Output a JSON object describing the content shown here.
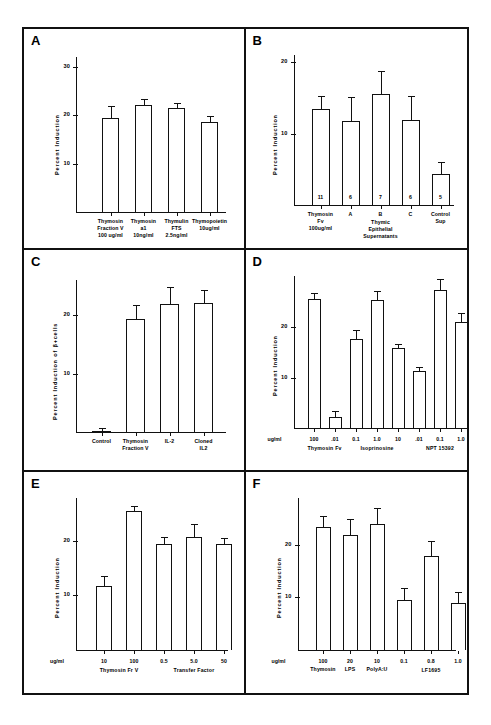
{
  "figure": {
    "panels": [
      "A",
      "B",
      "C",
      "D",
      "E",
      "F"
    ]
  },
  "chart_data": [
    {
      "panel": "A",
      "type": "bar",
      "title": "",
      "ylabel": "Percent Induction",
      "xlabel": "",
      "ylim": [
        0,
        32
      ],
      "yticks": [
        10,
        20,
        30
      ],
      "ytick_labels": [
        "10",
        "20",
        "30"
      ],
      "grid": false,
      "categories": [
        "Thymosin Fraction V 100 ug/ml",
        "Thymosin a1 10ng/ml",
        "Thymulin FTS 2.5ng/ml",
        "Thymopoietin 10ug/ml"
      ],
      "xtick_labels": [
        [
          "Thymosin",
          "Fraction V",
          "100 ug/ml"
        ],
        [
          "Thymosin",
          "a1",
          "10ng/ml"
        ],
        [
          "Thymulin",
          "FTS",
          "2.5ng/ml"
        ],
        [
          "Thymopoietin",
          "",
          "10ug/ml"
        ]
      ],
      "values": [
        19.5,
        22.0,
        21.5,
        18.5
      ],
      "errors": [
        2.4,
        1.3,
        1.0,
        1.4
      ]
    },
    {
      "panel": "B",
      "type": "bar",
      "title": "",
      "ylabel": "Percent Induction",
      "xlabel": "",
      "ylim": [
        0,
        21
      ],
      "yticks": [
        10,
        20
      ],
      "ytick_labels": [
        "10",
        "20"
      ],
      "grid": false,
      "categories": [
        "Thymosin Fv 100ug/ml",
        "A",
        "B",
        "C",
        "Control Sup"
      ],
      "xtick_labels": [
        [
          "Thymosin",
          "Fv",
          "100ug/ml"
        ],
        [
          "A",
          "",
          ""
        ],
        [
          "B",
          "",
          ""
        ],
        [
          "C",
          "",
          ""
        ],
        [
          "Control",
          "Sup",
          ""
        ]
      ],
      "group_labels": [
        "Thymic Epithelial Supernatants"
      ],
      "values": [
        13.4,
        11.8,
        15.6,
        11.9,
        4.3
      ],
      "errors": [
        1.8,
        3.3,
        3.2,
        3.3,
        1.7
      ],
      "n_labels": [
        "11",
        "6",
        "7",
        "6",
        "5"
      ]
    },
    {
      "panel": "C",
      "type": "bar",
      "title": "",
      "ylabel": "Percent Induction of β+cells",
      "xlabel": "",
      "ylim": [
        0,
        26
      ],
      "yticks": [
        10,
        20
      ],
      "ytick_labels": [
        "10",
        "20"
      ],
      "grid": false,
      "categories": [
        "Control",
        "Thymosin Fraction V",
        "IL-2",
        "Cloned IL2"
      ],
      "xtick_labels": [
        [
          "Control",
          ""
        ],
        [
          "Thymosin",
          "Fraction V"
        ],
        [
          "IL-2",
          ""
        ],
        [
          "Cloned",
          "IL2"
        ]
      ],
      "values": [
        0.3,
        19.4,
        22.0,
        22.1
      ],
      "errors": [
        0.4,
        2.3,
        2.8,
        2.2
      ]
    },
    {
      "panel": "D",
      "type": "bar",
      "title": "",
      "ylabel": "Percent Induction",
      "xlabel": "",
      "ylim": [
        0,
        30
      ],
      "yticks": [
        10,
        20
      ],
      "ytick_labels": [
        "10",
        "20"
      ],
      "grid": false,
      "unit_label": "ug/ml",
      "categories": [
        "100",
        ".01",
        "0.1",
        "1.0",
        "10",
        ".01",
        "0.1",
        "1.0"
      ],
      "values": [
        25.5,
        2.3,
        17.6,
        25.4,
        15.8,
        11.4,
        27.3,
        21.0
      ],
      "errors": [
        1.3,
        1.1,
        1.9,
        1.7,
        0.8,
        0.8,
        2.2,
        1.8
      ],
      "group_labels": [
        "Thymosin Fv",
        "Isoprinosine",
        "NPT 15392"
      ],
      "group_spans": [
        [
          0,
          1
        ],
        [
          2,
          4
        ],
        [
          5,
          7
        ]
      ]
    },
    {
      "panel": "E",
      "type": "bar",
      "title": "",
      "ylabel": "Percent Induction",
      "xlabel": "",
      "ylim": [
        0,
        28
      ],
      "yticks": [
        10,
        20
      ],
      "ytick_labels": [
        "10",
        "20"
      ],
      "grid": false,
      "unit_label": "ug/ml",
      "categories": [
        "10",
        "100",
        "0.5",
        "5.0",
        "50"
      ],
      "values": [
        11.7,
        25.5,
        19.5,
        20.8,
        19.5
      ],
      "errors": [
        1.9,
        0.9,
        1.2,
        2.4,
        1.1
      ],
      "group_labels": [
        "Thymosin Fr V",
        "Transfer Factor"
      ],
      "group_spans": [
        [
          0,
          1
        ],
        [
          2,
          4
        ]
      ]
    },
    {
      "panel": "F",
      "type": "bar",
      "title": "",
      "ylabel": "Percent Induction",
      "xlabel": "",
      "ylim": [
        0,
        29
      ],
      "yticks": [
        10,
        20
      ],
      "ytick_labels": [
        "10",
        "20"
      ],
      "grid": false,
      "unit_label": "ug/ml",
      "categories": [
        "100",
        "20",
        "10",
        "0.1",
        "0.8",
        "1.0"
      ],
      "values": [
        23.4,
        21.8,
        24.0,
        9.4,
        17.8,
        8.9
      ],
      "errors": [
        2.1,
        3.2,
        3.1,
        2.4,
        3.0,
        2.1
      ],
      "sub_labels": [
        "Thymosin",
        "LPS",
        "PolyA:U",
        "",
        "",
        ""
      ],
      "group_labels": [
        "LF1695"
      ],
      "group_spans": [
        [
          3,
          5
        ]
      ]
    }
  ]
}
